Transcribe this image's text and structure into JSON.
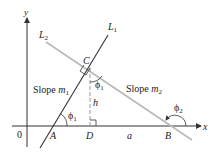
{
  "diagram": {
    "axes": {
      "x_label": "x",
      "y_label": "y",
      "origin_label": "0"
    },
    "lines": {
      "L1": "L",
      "L1_sub": "1",
      "L2": "L",
      "L2_sub": "2"
    },
    "points": {
      "A": "A",
      "B": "B",
      "C": "C",
      "D": "D"
    },
    "labels": {
      "slope1": "Slope ",
      "slope1_var": "m",
      "slope1_sub": "1",
      "slope2": "Slope ",
      "slope2_var": "m",
      "slope2_sub": "2",
      "h": "h",
      "a": "a",
      "phi": "ϕ",
      "phi1_sub": "1",
      "phi2_sub": "2"
    },
    "colors": {
      "L1": "#333333",
      "L2": "#b8b8b8",
      "axis": "#333333",
      "dashed": "#999999"
    }
  }
}
